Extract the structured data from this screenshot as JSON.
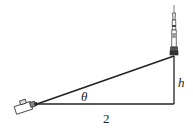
{
  "diagram": {
    "type": "right-triangle",
    "labels": {
      "angle": "θ",
      "height": "h",
      "base": "2"
    },
    "objects": {
      "observer": "camera-icon",
      "target": "rocket-icon"
    },
    "colors": {
      "line": "#222222",
      "background": "#ffffff"
    }
  }
}
